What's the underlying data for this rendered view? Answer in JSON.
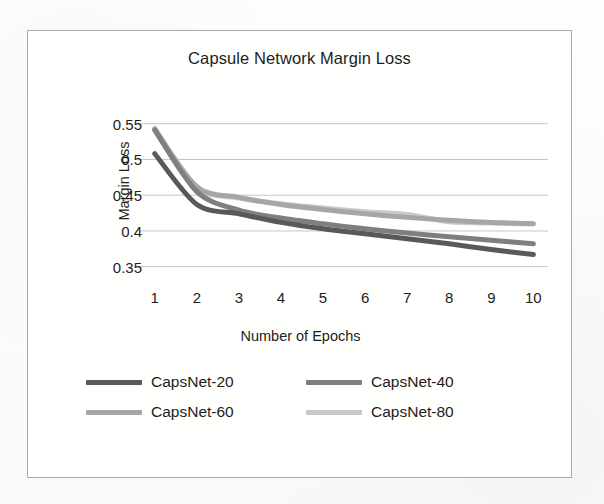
{
  "figure": {
    "title": "Capsule Network Margin Loss"
  },
  "chart_data": {
    "type": "line",
    "title": "Capsule Network Margin Loss",
    "xlabel": "Number of Epochs",
    "ylabel": "Margin Loss",
    "x": [
      1,
      2,
      3,
      4,
      5,
      6,
      7,
      8,
      9,
      10
    ],
    "xtick_labels": [
      "1",
      "2",
      "3",
      "4",
      "5",
      "6",
      "7",
      "8",
      "9",
      "10"
    ],
    "ytick_labels": [
      "0.55",
      "0.5",
      "0.45",
      "0.4",
      "0.35"
    ],
    "ytick_values": [
      0.55,
      0.5,
      0.45,
      0.4,
      0.35
    ],
    "ylim": [
      0.33,
      0.565
    ],
    "xlim": [
      0.72,
      10.3
    ],
    "grid": "horizontal",
    "legend_position": "bottom",
    "series": [
      {
        "name": "CapsNet-20",
        "color": "#595959",
        "values": [
          0.508,
          0.437,
          0.424,
          0.412,
          0.403,
          0.396,
          0.389,
          0.382,
          0.374,
          0.367
        ]
      },
      {
        "name": "CapsNet-40",
        "color": "#7f7f7f",
        "values": [
          0.541,
          0.455,
          0.429,
          0.418,
          0.41,
          0.403,
          0.397,
          0.392,
          0.387,
          0.382
        ]
      },
      {
        "name": "CapsNet-60",
        "color": "#a6a6a6",
        "values": [
          0.543,
          0.462,
          0.447,
          0.437,
          0.43,
          0.424,
          0.419,
          0.415,
          0.412,
          0.41
        ]
      },
      {
        "name": "CapsNet-80",
        "color": "#c9c9c9",
        "values": [
          0.541,
          0.46,
          0.446,
          0.438,
          0.432,
          0.427,
          0.423,
          0.413,
          0.411,
          0.41
        ]
      }
    ]
  },
  "legend": {
    "items": [
      {
        "label": "CapsNet-20",
        "color": "#595959"
      },
      {
        "label": "CapsNet-40",
        "color": "#7f7f7f"
      },
      {
        "label": "CapsNet-60",
        "color": "#a6a6a6"
      },
      {
        "label": "CapsNet-80",
        "color": "#c9c9c9"
      }
    ]
  },
  "style": {
    "gridline_color": "#c6c6c4",
    "text_color": "#1d1d1b",
    "frame_color": "#a9a9a6"
  }
}
